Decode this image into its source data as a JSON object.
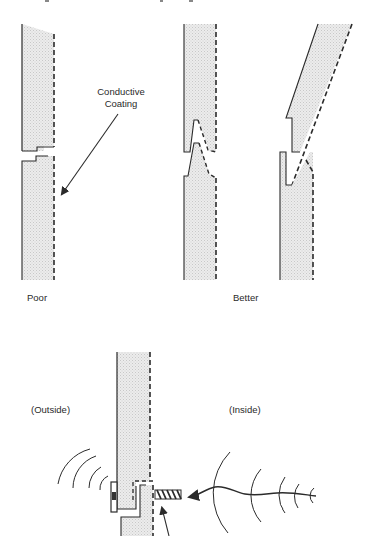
{
  "diagram": {
    "type": "technical-illustration",
    "colors": {
      "line": "#2b2b2b",
      "fill": "#e6e6e6",
      "background": "#ffffff",
      "text": "#2a2a2a"
    },
    "top_panels": {
      "callout": {
        "line1": "Conductive",
        "line2": "Coating"
      },
      "captions": {
        "poor": "Poor",
        "better": "Better"
      },
      "joints": [
        {
          "id": "poor-joint",
          "style": "stepped butt joint",
          "rating": "Poor"
        },
        {
          "id": "better-joint-tongue",
          "style": "angled tongue-and-groove",
          "rating": "Better"
        },
        {
          "id": "better-joint-slanted",
          "style": "slanted overlap hook",
          "rating": "Better"
        }
      ]
    },
    "bottom_panel": {
      "labels": {
        "outside": "(Outside)",
        "inside": "(Inside)"
      },
      "elements": [
        {
          "id": "wall-panel",
          "description": "vertical wall with dashed conductive coating on inside face"
        },
        {
          "id": "gasket-clip",
          "description": "clip/gasket at step joint on outside face"
        },
        {
          "id": "screw",
          "description": "threaded screw through joint on inside"
        },
        {
          "id": "emi-wave-inside",
          "description": "incoming wave arrow with arcs from inside"
        },
        {
          "id": "emi-wave-outside",
          "description": "radiating arcs on outside"
        }
      ]
    }
  }
}
